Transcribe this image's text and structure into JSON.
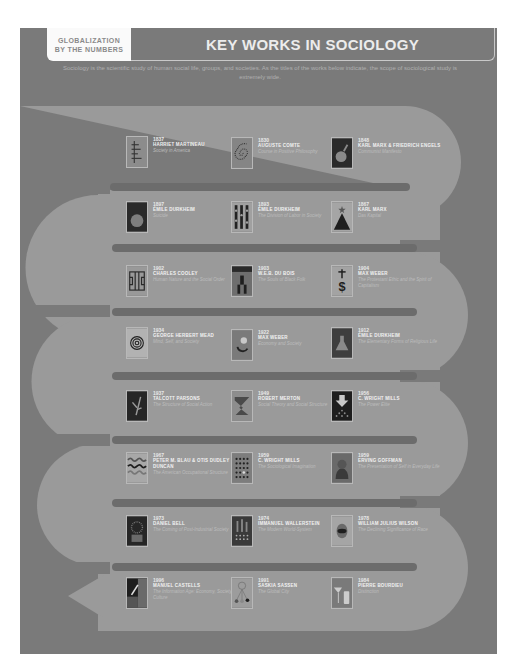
{
  "header": {
    "tab_line1": "GLOBALIZATION",
    "tab_line2": "BY THE NUMBERS",
    "title": "KEY WORKS IN SOCIOLOGY",
    "intro": "Sociology is the scientific study of human social life, groups, and societies. As the titles of the works below indicate, the scope of sociological study is extremely wide."
  },
  "colors": {
    "background": "#7a7a7a",
    "band": "#9a9a9a",
    "separator": "#6c6c6c",
    "title_text": "#ececec"
  },
  "works": [
    {
      "year": "1837",
      "author": "Harriet Martineau",
      "title": "Society in America",
      "icon": "vertical-line-chart-icon"
    },
    {
      "year": "1830",
      "author": "Auguste Comte",
      "title": "Course in Positive Philosophy",
      "icon": "spiral-icon"
    },
    {
      "year": "1848",
      "author": "Karl Marx & Friedrich Engels",
      "title": "Communist Manifesto",
      "icon": "bomb-icon"
    },
    {
      "year": "1897",
      "author": "Émile Durkheim",
      "title": "Suicide",
      "icon": "circle-icon"
    },
    {
      "year": "1893",
      "author": "Émile Durkheim",
      "title": "The Division of Labor in Society",
      "icon": "people-grid-icon"
    },
    {
      "year": "1867",
      "author": "Karl Marx",
      "title": "Das Kapital",
      "icon": "pyramid-star-icon"
    },
    {
      "year": "1902",
      "author": "Charles Cooley",
      "title": "Human Nature and the Social Order",
      "icon": "maze-icon"
    },
    {
      "year": "1903",
      "author": "W.E.B. Du Bois",
      "title": "The Souls of Black Folk",
      "icon": "figure-icon"
    },
    {
      "year": "1904",
      "author": "Max Weber",
      "title": "The Protestant Ethic and the Spirit of Capitalism",
      "icon": "cross-dollar-icon"
    },
    {
      "year": "1934",
      "author": "George Herbert Mead",
      "title": "Mind, Self, and Society",
      "icon": "target-icon"
    },
    {
      "year": "1922",
      "author": "Max Weber",
      "title": "Economy and Society",
      "icon": "circular-arrows-icon"
    },
    {
      "year": "1912",
      "author": "Émile Durkheim",
      "title": "The Elementary Forms of Religious Life",
      "icon": "flask-icon"
    },
    {
      "year": "1937",
      "author": "Talcott Parsons",
      "title": "The Structure of Social Action",
      "icon": "plant-icon"
    },
    {
      "year": "1949",
      "author": "Robert Merton",
      "title": "Social Theory and Social Structure",
      "icon": "zigzag-icon"
    },
    {
      "year": "1956",
      "author": "C. Wright Mills",
      "title": "The Power Elite",
      "icon": "down-arrow-icon"
    },
    {
      "year": "1967",
      "author": "Peter M. Blau & Otis Dudley Duncan",
      "title": "The American Occupational Structure",
      "icon": "waves-icon"
    },
    {
      "year": "1959",
      "author": "C. Wright Mills",
      "title": "The Sociological Imagination",
      "icon": "dot-grid-icon"
    },
    {
      "year": "1959",
      "author": "Erving Goffman",
      "title": "The Presentation of Self in Everyday Life",
      "icon": "face-icon"
    },
    {
      "year": "1973",
      "author": "Daniel Bell",
      "title": "The Coming of Post-Industrial Society",
      "icon": "factory-icon"
    },
    {
      "year": "1974",
      "author": "Immanuel Wallerstein",
      "title": "The Modern World-System",
      "icon": "buildings-icon"
    },
    {
      "year": "1978",
      "author": "William Julius Wilson",
      "title": "The Declining Significance of Race",
      "icon": "eye-icon"
    },
    {
      "year": "1996",
      "author": "Manuel Castells",
      "title": "The Information Age: Economy, Society, and Culture",
      "icon": "pencil-icon"
    },
    {
      "year": "1991",
      "author": "Saskia Sassen",
      "title": "The Global City",
      "icon": "network-icon"
    },
    {
      "year": "1984",
      "author": "Pierre Bourdieu",
      "title": "Distinction",
      "icon": "glass-bottle-icon"
    }
  ]
}
